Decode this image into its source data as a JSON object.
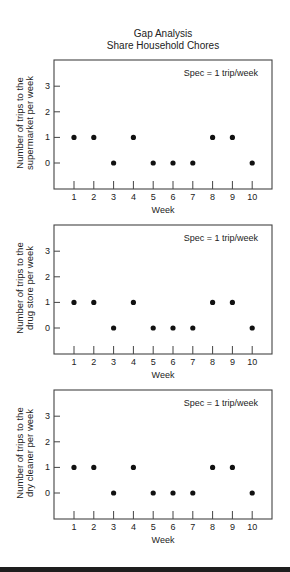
{
  "header": {
    "title": "Gap Analysis",
    "subtitle": "Share Household Chores"
  },
  "chart_data": [
    {
      "type": "scatter",
      "title": "Gap Analysis - Share Household Chores",
      "xlabel": "Week",
      "ylabel": "Number of trips to the supermarket per week",
      "ylabel_lines": [
        "Number of trips to the",
        "supermarket per week"
      ],
      "annotation": "Spec = 1 trip/week",
      "x": [
        1,
        2,
        3,
        4,
        5,
        6,
        7,
        8,
        9,
        10
      ],
      "values": [
        1,
        1,
        0,
        1,
        0,
        0,
        0,
        1,
        1,
        0
      ],
      "x_ticks": [
        "1",
        "2",
        "3",
        "4",
        "5",
        "6",
        "7",
        "8",
        "9",
        "10"
      ],
      "y_ticks": [
        "0",
        "1",
        "2",
        "3"
      ],
      "ylim": [
        -1,
        4
      ],
      "xlim": [
        0,
        11
      ],
      "grid": false
    },
    {
      "type": "scatter",
      "xlabel": "Week",
      "ylabel": "Number of trips to the drug store per week",
      "ylabel_lines": [
        "Number of trips to the",
        "drug store per week"
      ],
      "annotation": "Spec = 1 trip/week",
      "x": [
        1,
        2,
        3,
        4,
        5,
        6,
        7,
        8,
        9,
        10
      ],
      "values": [
        1,
        1,
        0,
        1,
        0,
        0,
        0,
        1,
        1,
        0
      ],
      "x_ticks": [
        "1",
        "2",
        "3",
        "4",
        "5",
        "6",
        "7",
        "8",
        "9",
        "10"
      ],
      "y_ticks": [
        "0",
        "1",
        "2",
        "3"
      ],
      "ylim": [
        -1,
        4
      ],
      "xlim": [
        0,
        11
      ],
      "grid": false
    },
    {
      "type": "scatter",
      "xlabel": "Week",
      "ylabel": "Number of trips to the dry cleaner per week",
      "ylabel_lines": [
        "Number of trips to the",
        "dry cleaner per week"
      ],
      "annotation": "Spec = 1 trip/week",
      "x": [
        1,
        2,
        3,
        4,
        5,
        6,
        7,
        8,
        9,
        10
      ],
      "values": [
        1,
        1,
        0,
        1,
        0,
        0,
        0,
        1,
        1,
        0
      ],
      "x_ticks": [
        "1",
        "2",
        "3",
        "4",
        "5",
        "6",
        "7",
        "8",
        "9",
        "10"
      ],
      "y_ticks": [
        "0",
        "1",
        "2",
        "3"
      ],
      "ylim": [
        -1,
        4
      ],
      "xlim": [
        0,
        11
      ],
      "grid": false
    }
  ]
}
